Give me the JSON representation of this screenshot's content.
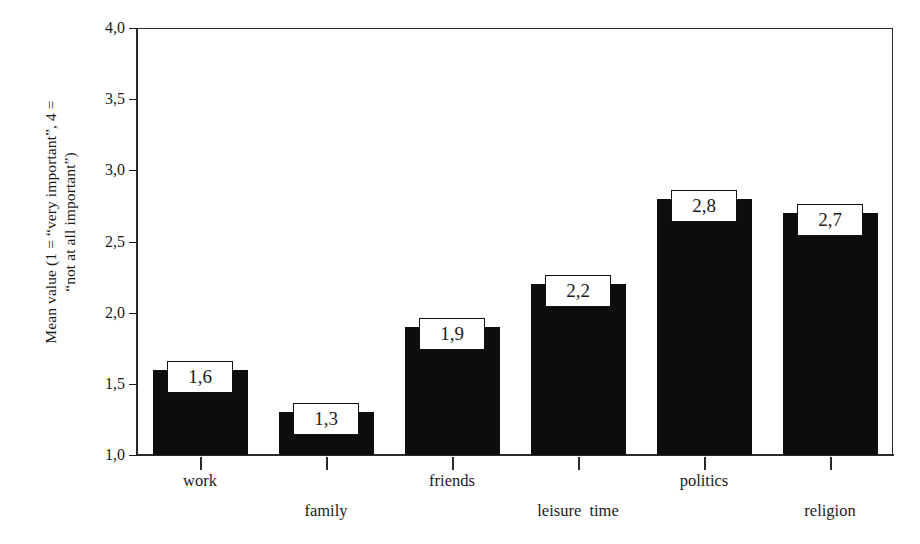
{
  "chart_data": {
    "type": "bar",
    "title": "",
    "xlabel": "",
    "ylabel_line1": "Mean value (1 = “very important”, 4 =",
    "ylabel_line2": "“not at all important”)",
    "categories": [
      "work",
      "family",
      "friends",
      "leisure  time",
      "politics",
      "religion"
    ],
    "values": [
      1.6,
      1.3,
      1.9,
      2.2,
      2.8,
      2.7
    ],
    "value_labels": [
      "1,6",
      "1,3",
      "1,9",
      "2,2",
      "2,8",
      "2,7"
    ],
    "ylim": [
      1.0,
      4.0
    ],
    "ytick_values": [
      4.0,
      3.5,
      3.0,
      2.5,
      2.0,
      1.5,
      1.0
    ],
    "ytick_labels": [
      "4,0",
      "3,5",
      "3,0",
      "2,5",
      "2,0",
      "1,5",
      "1,0"
    ],
    "decimal_separator": ",",
    "grid": false,
    "legend": "none",
    "bar_color": "#0d0d0d",
    "label_box_fill": "#ffffff",
    "label_box_border": "#111111",
    "axis_color": "#2a2a2a",
    "label_rows": [
      0,
      1,
      0,
      1,
      0,
      1
    ]
  },
  "figure": {
    "background": "#ffffff",
    "cropped_title_ghost": ""
  }
}
